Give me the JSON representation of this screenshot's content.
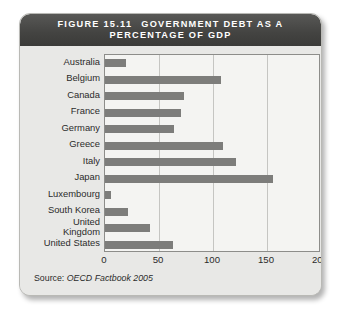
{
  "figure": {
    "number": "FIGURE 15.11",
    "title_line1": "GOVERNMENT DEBT AS A",
    "title_line2": "PERCENTAGE OF GDP",
    "source_prefix": "Source:",
    "source_title": "OECD Factbook 2005"
  },
  "colors": {
    "header_bg": "#434341",
    "panel_bg": "#e8e8e6",
    "plot_bg": "#f4f4f2",
    "bar": "#7d7d7b",
    "gridline": "#c5c5c2",
    "frame": "#8d8d8a",
    "text": "#2b2b2b"
  },
  "chart_data": {
    "type": "bar",
    "orientation": "horizontal",
    "xlabel": "",
    "ylabel": "",
    "xlim": [
      0,
      200
    ],
    "xticks": [
      0,
      50,
      100,
      150,
      200
    ],
    "xtick_labels": [
      "0",
      "50",
      "100",
      "150",
      "200"
    ],
    "grid": true,
    "legend": false,
    "source": "Source: OECD Factbook 2005",
    "categories": [
      "Australia",
      "Belgium",
      "Canada",
      "France",
      "Germany",
      "Greece",
      "Italy",
      "Japan",
      "Luxembourg",
      "South Korea",
      "United\nKingdom",
      "United States"
    ],
    "values": [
      19,
      107,
      73,
      70,
      64,
      109,
      121,
      156,
      6,
      21,
      42,
      63
    ]
  }
}
